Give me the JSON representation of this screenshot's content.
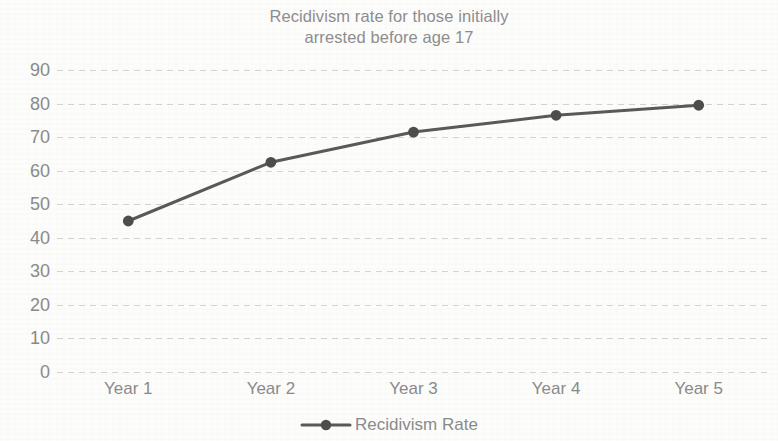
{
  "chart_data": {
    "type": "line",
    "title": "Recidivism rate for those initially arrested before age 17",
    "title_lines": [
      "Recidivism rate for those initially",
      "arrested before age 17"
    ],
    "categories": [
      "Year 1",
      "Year 2",
      "Year 3",
      "Year 4",
      "Year 5"
    ],
    "series": [
      {
        "name": "Recidivism Rate",
        "values": [
          45,
          62.5,
          71.5,
          76.5,
          79.5
        ]
      }
    ],
    "xlabel": "",
    "ylabel": "",
    "ylim": [
      0,
      90
    ],
    "yticks": [
      0,
      10,
      20,
      30,
      40,
      50,
      60,
      70,
      80,
      90
    ],
    "ytick_labels": [
      "0",
      "10",
      "20",
      "30",
      "40",
      "50",
      "60",
      "70",
      "80",
      "90"
    ],
    "grid": true,
    "grid_style": "dotted-horizontal",
    "legend_position": "bottom",
    "legend_entries": [
      "Recidivism Rate"
    ],
    "colors": {
      "series_line": "#595959",
      "marker": "#4d4d4d",
      "text": "#8a8a8a",
      "title_text": "#8d8d8d",
      "gridline": "#c8c8c8",
      "background": "#fdfdfc"
    },
    "marker_style": "circle",
    "line_width": 3
  },
  "legend": {
    "label": "Recidivism Rate",
    "marker_icon": "line-marker-icon"
  }
}
